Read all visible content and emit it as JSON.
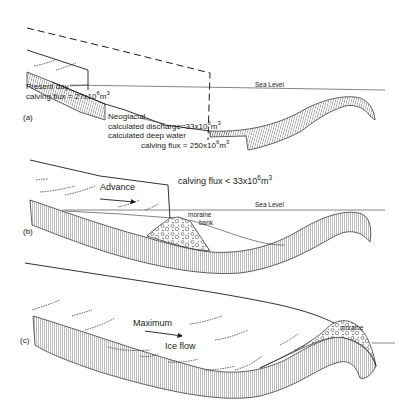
{
  "figure": {
    "panels": [
      {
        "id": "a",
        "label": "(a)",
        "sea_level_label": "Sea Level",
        "present_day": {
          "line1": "Present day",
          "line2_prefix": "calving flux = 27x10",
          "exp": "6",
          "unit": "m",
          "unit_exp": "3"
        },
        "neoglacial": {
          "title": "Neoglacial",
          "discharge_prefix": "calculated discharge=33x10",
          "discharge_exp": "6",
          "discharge_unit": "m",
          "discharge_unit_exp": "3",
          "deep_water": "calculated deep water",
          "calving_prefix": "calving flux = 250x10",
          "calving_exp": "6",
          "calving_unit": "m",
          "calving_unit_exp": "3"
        }
      },
      {
        "id": "b",
        "label": "(b)",
        "sea_level_label": "Sea Level",
        "advance_label": "Advance",
        "calving": {
          "prefix": "calving flux < 33x10",
          "exp": "6",
          "unit": "m",
          "unit_exp": "3"
        },
        "moraine_line1": "moraine",
        "moraine_line2": "bank"
      },
      {
        "id": "c",
        "label": "(c)",
        "maximum_label": "Maximum",
        "ice_flow_label": "Ice flow",
        "moraine_label": "moraine"
      }
    ]
  }
}
